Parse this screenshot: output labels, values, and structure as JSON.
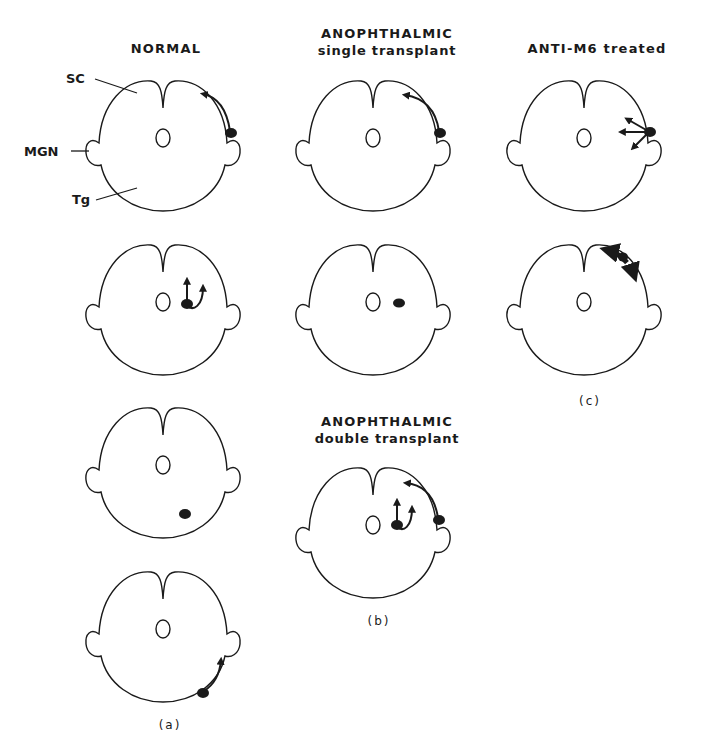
{
  "figure": {
    "columns": [
      {
        "id": "a",
        "title": "NORMAL",
        "subtitle": "",
        "panel_letter": "(a)"
      },
      {
        "id": "b",
        "title": "ANOPHTHALMIC",
        "subtitle": "single transplant",
        "panel_letter": "(b)"
      },
      {
        "id": "c",
        "title": "ANTI-M6  treated",
        "subtitle": "",
        "panel_letter": "(c)"
      }
    ],
    "secondary_title": {
      "title": "ANOPHTHALMIC",
      "subtitle": "double transplant"
    },
    "anatomy_labels": [
      "SC",
      "MGN",
      "Tg"
    ],
    "sections": [
      {
        "column": "a",
        "row": 1,
        "pattern": "dorsolateral cell with arrow curving dorsomedially"
      },
      {
        "column": "a",
        "row": 2,
        "pattern": "medial cell with two dorsal arrows"
      },
      {
        "column": "a",
        "row": 3,
        "pattern": "ventral cell, no arrow"
      },
      {
        "column": "a",
        "row": 4,
        "pattern": "ventral cell with arrow to lateral"
      },
      {
        "column": "b",
        "row": 1,
        "pattern": "dorsolateral cell with arrow curving dorsomedially"
      },
      {
        "column": "b",
        "row": 2,
        "pattern": "medial cell, no arrow"
      },
      {
        "column": "b",
        "row": 3,
        "pattern": "lateral cell with curved arrow plus medial cell with two dorsal arrows"
      },
      {
        "column": "c",
        "row": 1,
        "pattern": "lateral cell with three divergent arrows"
      },
      {
        "column": "c",
        "row": 2,
        "pattern": "dorsal cells with bidirectional dashed arrow along surface"
      }
    ],
    "colors": {
      "ink": "#1a1a1a",
      "background": "#ffffff"
    }
  }
}
